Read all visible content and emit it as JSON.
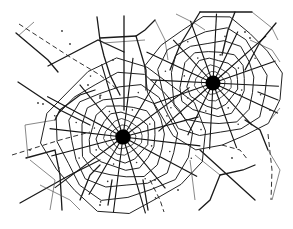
{
  "title": "",
  "diagram": {
    "kind": "voronoi-tessellation-with-two-radial-centers",
    "colors": {
      "line": "#1a1a1a",
      "thin_line": "#555555",
      "background": "#ffffff"
    },
    "centers": [
      {
        "id": "center-a",
        "label": "",
        "rings": 9,
        "spokes": 16
      },
      {
        "id": "center-b",
        "label": "",
        "rings": 8,
        "spokes": 16
      }
    ],
    "text_labels": []
  }
}
